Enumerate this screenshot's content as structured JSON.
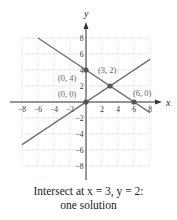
{
  "chart_data": {
    "type": "line",
    "title": "",
    "xlabel": "x",
    "ylabel": "y",
    "xlim": [
      -8,
      8
    ],
    "ylim": [
      -8,
      8
    ],
    "grid": true,
    "x_ticks": [
      -8,
      -6,
      -4,
      -2,
      2,
      4,
      6,
      8
    ],
    "y_ticks": [
      8,
      6,
      4,
      2,
      -2,
      -4,
      -6,
      -8
    ],
    "series": [
      {
        "name": "decreasing line",
        "points": [
          [
            -6,
            8
          ],
          [
            0,
            4
          ],
          [
            3,
            2
          ],
          [
            6,
            0
          ],
          [
            8,
            -1.33
          ]
        ]
      },
      {
        "name": "increasing line",
        "points": [
          [
            -8,
            -5.33
          ],
          [
            0,
            0
          ],
          [
            3,
            2
          ],
          [
            8,
            5.33
          ]
        ]
      }
    ],
    "annotations": [
      {
        "label": "(0, 4)",
        "x": 0,
        "y": 4
      },
      {
        "label": "(3, 2)",
        "x": 3,
        "y": 2
      },
      {
        "label": "(0, 0)",
        "x": 0,
        "y": 0
      },
      {
        "label": "(6, 0)",
        "x": 6,
        "y": 0
      }
    ]
  },
  "caption": {
    "line1": "Intersect at  x = 3,  y = 2:",
    "line2": "one solution"
  },
  "colors": {
    "line": "#6e6e6e",
    "axis": "#333333",
    "grid": "#c8c8c8",
    "point": "#555555"
  }
}
